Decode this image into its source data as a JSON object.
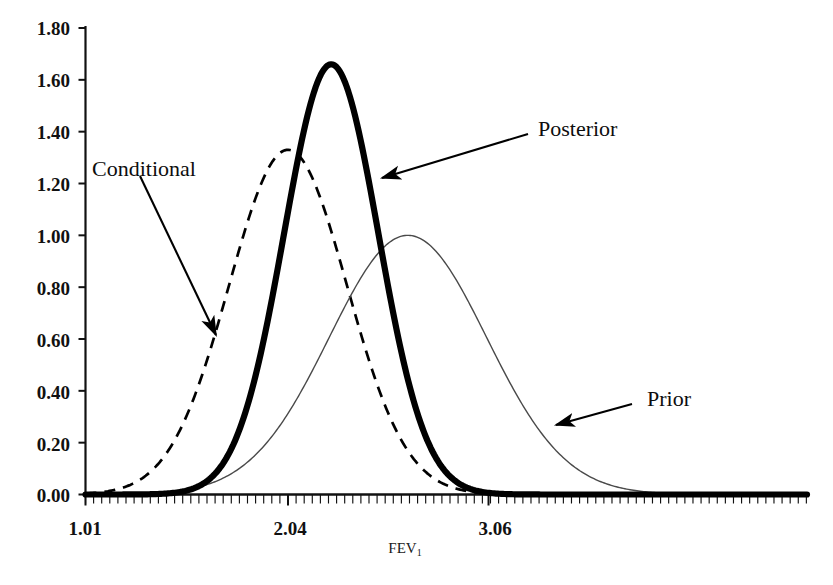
{
  "chart_data": {
    "type": "line",
    "title": "",
    "xlabel": "FEV1",
    "xlabel_base": "FEV",
    "xlabel_sub": "1",
    "ylabel": "",
    "xlim": [
      1.01,
      4.68
    ],
    "ylim": [
      0.0,
      1.8
    ],
    "xticks": [
      "1.01",
      "2.04",
      "3.06"
    ],
    "xtick_values": [
      1.01,
      2.04,
      3.06
    ],
    "yticks": [
      "0.00",
      "0.20",
      "0.40",
      "0.60",
      "0.80",
      "1.00",
      "1.20",
      "1.40",
      "1.60",
      "1.80"
    ],
    "ytick_values": [
      0.0,
      0.2,
      0.4,
      0.6,
      0.8,
      1.0,
      1.2,
      1.4,
      1.6,
      1.8
    ],
    "grid": false,
    "legend": "annotations",
    "minor_tick_density": "dense",
    "series": [
      {
        "name": "Conditional",
        "style": "dashed",
        "color": "#000000",
        "linewidth": 2.6,
        "peak_x": 2.04,
        "peak_y": 1.33,
        "mean": 2.04,
        "sd": 0.3,
        "amplitude": 1.33
      },
      {
        "name": "Posterior",
        "style": "solid-bold",
        "color": "#000000",
        "linewidth": 6.0,
        "peak_x": 2.26,
        "peak_y": 1.66,
        "mean": 2.26,
        "sd": 0.24,
        "amplitude": 1.66
      },
      {
        "name": "Prior",
        "style": "solid-thin",
        "color": "#444444",
        "linewidth": 1.3,
        "peak_x": 2.65,
        "peak_y": 1.0,
        "mean": 2.65,
        "sd": 0.4,
        "amplitude": 1.0
      }
    ],
    "annotations": [
      {
        "id": "conditional",
        "text": "Conditional",
        "label_x": 92,
        "label_y": 156,
        "arrow_from_x": 140,
        "arrow_from_y": 176,
        "arrow_to_x": 216,
        "arrow_to_y": 335
      },
      {
        "id": "posterior",
        "text": "Posterior",
        "label_x": 538,
        "label_y": 116,
        "arrow_from_x": 528,
        "arrow_from_y": 134,
        "arrow_to_x": 382,
        "arrow_to_y": 178
      },
      {
        "id": "prior",
        "text": "Prior",
        "label_x": 647,
        "label_y": 386,
        "arrow_from_x": 632,
        "arrow_from_y": 404,
        "arrow_to_x": 556,
        "arrow_to_y": 425
      }
    ]
  },
  "axes": {
    "y_labels": [
      "1.80",
      "1.60",
      "1.40",
      "1.20",
      "1.00",
      "0.80",
      "0.60",
      "0.40",
      "0.20",
      "0.00"
    ],
    "x_labels": [
      "1.01",
      "2.04",
      "3.06"
    ]
  }
}
